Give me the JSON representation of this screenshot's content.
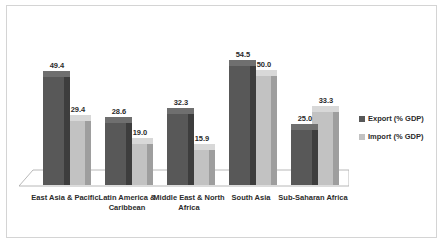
{
  "chart_data": {
    "type": "bar",
    "title": "",
    "subtitle": "",
    "xlabel": "",
    "ylabel": "",
    "ylim": [
      0,
      60
    ],
    "grid": false,
    "legend_position": "right",
    "style": "3d-clustered-column",
    "categories": [
      "East Asia & Pacific",
      "Latin America & Caribbean",
      "Middle East & North Africa",
      "South Asia",
      "Sub-Saharan Africa"
    ],
    "series": [
      {
        "name": "Export (% GDP)",
        "color": "#585858",
        "values": [
          49.4,
          28.6,
          32.3,
          54.5,
          25.0
        ],
        "labels": [
          "49.4",
          "28.6",
          "32.3",
          "54.5",
          "25.0"
        ]
      },
      {
        "name": "Import (% GDP)",
        "color": "#c2c2c2",
        "values": [
          29.4,
          19.0,
          15.9,
          50.0,
          33.3
        ],
        "labels": [
          "29.4",
          "19.0",
          "15.9",
          "50.0",
          "33.3"
        ]
      }
    ]
  },
  "legend": {
    "items": [
      {
        "label": "Export (% GDP)"
      },
      {
        "label": "Import (% GDP)"
      }
    ]
  },
  "colors": {
    "export_front": "#585858",
    "export_side": "#3d3d3d",
    "export_top": "#6f6f6f",
    "import_front": "#c2c2c2",
    "import_side": "#9e9e9e",
    "import_top": "#d8d8d8",
    "frame_border": "#d4d4d4",
    "floor_line": "#a6a6a6",
    "text": "#2b2b2b"
  }
}
